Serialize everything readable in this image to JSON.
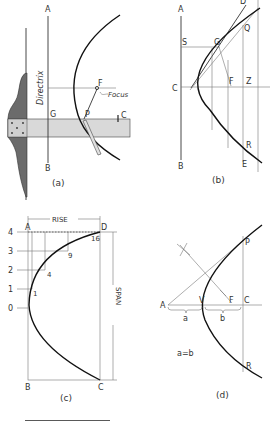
{
  "figure": {
    "panels": [
      {
        "id": "a",
        "caption": "(a)",
        "labels": {
          "A": "A",
          "B": "B",
          "G": "G",
          "P": "P",
          "F": "F",
          "C": "C",
          "directrix": "Directrix",
          "focus": "Focus"
        }
      },
      {
        "id": "b",
        "caption": "(b)",
        "labels": {
          "A": "A",
          "B": "B",
          "C": "C",
          "S": "S",
          "G": "G",
          "F": "F",
          "Z": "Z",
          "Q": "Q",
          "D": "D",
          "R": "R",
          "E": "E"
        }
      },
      {
        "id": "c",
        "caption": "(c)",
        "labels": {
          "A": "A",
          "B": "B",
          "C": "C",
          "D": "D",
          "rise": "RISE",
          "span": "SPAN",
          "ticks": [
            "4",
            "3",
            "2",
            "1",
            "0"
          ],
          "points": [
            "16",
            "9",
            "4",
            "1"
          ]
        }
      },
      {
        "id": "d",
        "caption": "(d)",
        "labels": {
          "A": "A",
          "V": "V",
          "F": "F",
          "C": "C",
          "P": "P",
          "R": "R",
          "a": "a",
          "b": "b",
          "equation": "a=b"
        }
      }
    ],
    "colors": {
      "line": "#333333",
      "curve": "#111111",
      "tsquare_head": "#6b6b6b",
      "tsquare_blade": "#d9d9d9"
    }
  }
}
